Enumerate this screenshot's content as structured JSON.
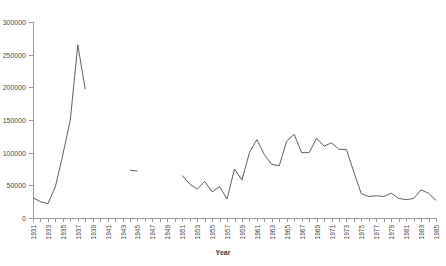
{
  "chart_data": {
    "type": "line",
    "title": "",
    "xlabel": "Year",
    "ylabel": "",
    "ylim": [
      0,
      300000
    ],
    "xlim": [
      1931,
      1985
    ],
    "grid": false,
    "legend": false,
    "legend_position": "none",
    "ytick_labels": [
      "0",
      "50000",
      "100000",
      "150000",
      "200000",
      "250000",
      "300000"
    ],
    "ytick_values": [
      0,
      50000,
      100000,
      150000,
      200000,
      250000,
      300000
    ],
    "xtick_labels": [
      "1931",
      "1933",
      "1935",
      "1937",
      "1939",
      "1941",
      "1943",
      "1945",
      "1947",
      "1949",
      "1951",
      "1953",
      "1955",
      "1957",
      "1959",
      "1961",
      "1963",
      "1965",
      "1967",
      "1969",
      "1971",
      "1973",
      "1975",
      "1977",
      "1979",
      "1981",
      "1983",
      "1985"
    ],
    "xtick_values": [
      1931,
      1933,
      1935,
      1937,
      1939,
      1941,
      1943,
      1945,
      1947,
      1949,
      1951,
      1953,
      1955,
      1957,
      1959,
      1961,
      1963,
      1965,
      1967,
      1969,
      1971,
      1973,
      1975,
      1977,
      1979,
      1981,
      1983,
      1985
    ],
    "series": [
      {
        "name": "",
        "color": "#4d4d4d",
        "x": [
          1931,
          1932,
          1933,
          1934,
          1935,
          1936,
          1937,
          1938,
          1944,
          1945,
          1951,
          1952,
          1953,
          1954,
          1955,
          1956,
          1957,
          1958,
          1959,
          1960,
          1961,
          1962,
          1963,
          1964,
          1965,
          1966,
          1967,
          1968,
          1969,
          1970,
          1971,
          1972,
          1973,
          1974,
          1975,
          1976,
          1977,
          1978,
          1979,
          1980,
          1981,
          1982,
          1983,
          1984,
          1985
        ],
        "values": [
          31000,
          25000,
          22000,
          48000,
          97000,
          150000,
          265000,
          197000,
          73000,
          72000,
          65000,
          52000,
          44000,
          56000,
          40000,
          48000,
          29000,
          75000,
          58000,
          100000,
          120000,
          97000,
          82000,
          80000,
          118000,
          128000,
          100000,
          100000,
          122000,
          110000,
          115000,
          105000,
          105000,
          70000,
          37000,
          33000,
          34000,
          33000,
          38000,
          30000,
          28000,
          30000,
          43000,
          38000,
          27000
        ]
      }
    ]
  }
}
